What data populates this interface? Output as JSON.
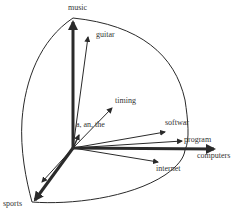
{
  "diagram": {
    "type": "vector-space",
    "axes": [
      {
        "label": "music",
        "direction": "up"
      },
      {
        "label": "computers",
        "direction": "right"
      },
      {
        "label": "sports",
        "direction": "down-left"
      }
    ],
    "term_vectors": [
      {
        "label": "guitar"
      },
      {
        "label": "timing"
      },
      {
        "label": "a, an, the"
      },
      {
        "label": "softwar"
      },
      {
        "label": "program"
      },
      {
        "label": "internet"
      }
    ],
    "colors": {
      "stroke": "#2a2a2a",
      "text": "#333333",
      "background": "#ffffff"
    }
  }
}
